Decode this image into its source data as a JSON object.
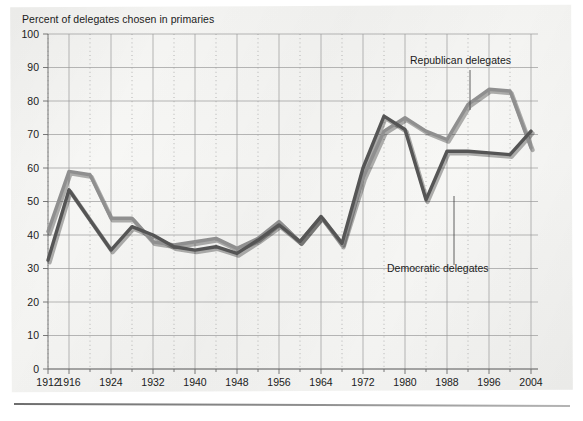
{
  "chart_title": "Percent of delegates chosen in primaries",
  "annotations": {
    "republican": "Republican delegates",
    "democratic": "Democratic delegates"
  },
  "axis": {
    "y_ticks": [
      "0",
      "10",
      "20",
      "30",
      "40",
      "50",
      "60",
      "70",
      "80",
      "90",
      "100"
    ],
    "x_ticks": [
      "1912",
      "1916",
      "1924",
      "1932",
      "1940",
      "1948",
      "1956",
      "1964",
      "1972",
      "1980",
      "1988",
      "1996",
      "2004"
    ]
  },
  "colors": {
    "republican": "#8f8f8f",
    "democratic": "#555555",
    "grid": "#9a9a9a",
    "text": "#1b1b1b",
    "paper": "#f4f4f2"
  },
  "chart_data": {
    "type": "line",
    "title": "Percent of delegates chosen in primaries",
    "xlabel": "",
    "ylabel": "Percent of delegates chosen in primaries",
    "ylim": [
      0,
      100
    ],
    "xlim": [
      1912,
      2004
    ],
    "grid": true,
    "legend": "inline-annotations",
    "x": [
      1912,
      1916,
      1920,
      1924,
      1928,
      1932,
      1936,
      1940,
      1944,
      1948,
      1952,
      1956,
      1960,
      1964,
      1968,
      1972,
      1976,
      1980,
      1984,
      1988,
      1992,
      1996,
      2000,
      2004
    ],
    "series": [
      {
        "name": "Republican delegates",
        "color": "#8f8f8f",
        "values": [
          41,
          59,
          58,
          45,
          45,
          38,
          37,
          38,
          39,
          36,
          39,
          44,
          38,
          45.5,
          37,
          57,
          71,
          75,
          71,
          68.5,
          79,
          83.5,
          83,
          66
        ]
      },
      {
        "name": "Democratic delegates",
        "color": "#555555",
        "values": [
          32.5,
          53.5,
          44.5,
          35.5,
          42.5,
          40,
          36.5,
          35.5,
          36.5,
          34.5,
          38.5,
          43,
          38,
          45.5,
          37.5,
          60,
          75.5,
          71.5,
          50.5,
          65,
          65,
          64.5,
          64,
          71
        ]
      }
    ],
    "y_tick_values": [
      0,
      10,
      20,
      30,
      40,
      50,
      60,
      70,
      80,
      90,
      100
    ],
    "x_tick_values": [
      1912,
      1916,
      1924,
      1932,
      1940,
      1948,
      1956,
      1964,
      1972,
      1980,
      1988,
      1996,
      2004
    ]
  }
}
